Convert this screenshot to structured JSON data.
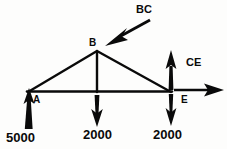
{
  "diagram": {
    "type": "engineering-free-body-diagram",
    "colors": {
      "ink": "#0a0a0a",
      "paper": "#fdfdfc"
    },
    "nodes": [
      {
        "id": "A",
        "label": "A",
        "x": 28,
        "y": 92,
        "role": "left-support"
      },
      {
        "id": "B",
        "label": "B",
        "x": 97,
        "y": 51,
        "role": "apex"
      },
      {
        "id": "E",
        "label": "E",
        "x": 171,
        "y": 92,
        "role": "right-support"
      }
    ],
    "members": [
      {
        "name": "A-B",
        "from": "A",
        "to": "B"
      },
      {
        "name": "B-E",
        "from": "B",
        "to": "E"
      },
      {
        "name": "A-E",
        "from": "A",
        "to": "E"
      },
      {
        "name": "B-C",
        "from": "B",
        "to": "C-bottom-chord"
      }
    ],
    "member_labels": [
      {
        "id": "BC",
        "label": "BC",
        "points_to": "member B-C"
      },
      {
        "id": "CE",
        "label": "CE",
        "points_to": "member C-E"
      }
    ],
    "forces": [
      {
        "id": "reaction-A",
        "label": "5000",
        "value": 5000,
        "direction": "up",
        "at_node": "A"
      },
      {
        "id": "load-C",
        "label": "2000",
        "value": 2000,
        "direction": "down",
        "at_node": "C"
      },
      {
        "id": "load-E",
        "label": "2000",
        "value": 2000,
        "direction": "down",
        "at_node": "E"
      },
      {
        "id": "force-CE",
        "label": "CE",
        "direction": "up",
        "at_node": "E"
      },
      {
        "id": "force-E-horizontal",
        "label": "",
        "direction": "right",
        "at_node": "E"
      },
      {
        "id": "force-BC",
        "label": "BC",
        "direction": "down-left",
        "at_node": "B"
      }
    ]
  }
}
